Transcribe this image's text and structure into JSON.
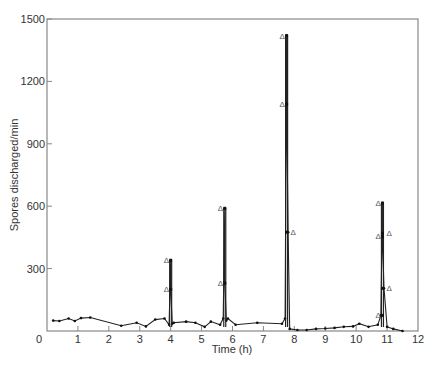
{
  "chart_data": {
    "type": "line",
    "title": "",
    "xlabel": "Time (h)",
    "ylabel": "Spores discharged/min",
    "xlim": [
      0,
      12
    ],
    "ylim": [
      0,
      1500
    ],
    "xticks": [
      0,
      1,
      2,
      3,
      4,
      5,
      6,
      7,
      8,
      9,
      10,
      11,
      12
    ],
    "yticks": [
      0,
      300,
      600,
      900,
      1200,
      1500
    ],
    "grid": false,
    "legend": null,
    "series": [
      {
        "name": "Spore discharge",
        "x": [
          0.2,
          0.4,
          0.7,
          0.9,
          1.1,
          1.4,
          2.4,
          2.9,
          3.2,
          3.5,
          3.8,
          3.95,
          4.0,
          4.0,
          4.05,
          4.1,
          4.5,
          4.8,
          5.1,
          5.3,
          5.6,
          5.7,
          5.75,
          5.75,
          5.8,
          5.85,
          6.1,
          6.8,
          7.6,
          7.7,
          7.75,
          7.75,
          7.8,
          7.85,
          8.1,
          8.4,
          8.7,
          9.0,
          9.3,
          9.6,
          9.9,
          10.1,
          10.4,
          10.7,
          10.8,
          10.85,
          10.85,
          10.9,
          11.0,
          11.2,
          11.5
        ],
        "y": [
          50,
          48,
          60,
          48,
          62,
          65,
          25,
          40,
          22,
          55,
          60,
          30,
          340,
          200,
          35,
          40,
          45,
          40,
          20,
          45,
          30,
          60,
          590,
          230,
          50,
          60,
          30,
          40,
          35,
          60,
          1420,
          1090,
          475,
          10,
          5,
          5,
          10,
          12,
          15,
          20,
          22,
          35,
          20,
          30,
          75,
          615,
          455,
          205,
          20,
          10,
          0
        ]
      }
    ],
    "peaks": [
      {
        "time": 4.0,
        "max": 340,
        "triangle_markers": [
          340,
          200
        ]
      },
      {
        "time": 5.75,
        "max": 590,
        "triangle_markers": [
          590,
          230
        ]
      },
      {
        "time": 7.75,
        "max": 1420,
        "triangle_markers": [
          1420,
          1090,
          475
        ]
      },
      {
        "time": 10.85,
        "max": 615,
        "triangle_markers": [
          615,
          455,
          470,
          205,
          75
        ]
      }
    ],
    "annotations": [
      "Δ markers indicate discharge events at peak points"
    ]
  },
  "labels": {
    "xlabel": "Time (h)",
    "ylabel": "Spores discharged/min",
    "marker_glyph": "Δ"
  }
}
